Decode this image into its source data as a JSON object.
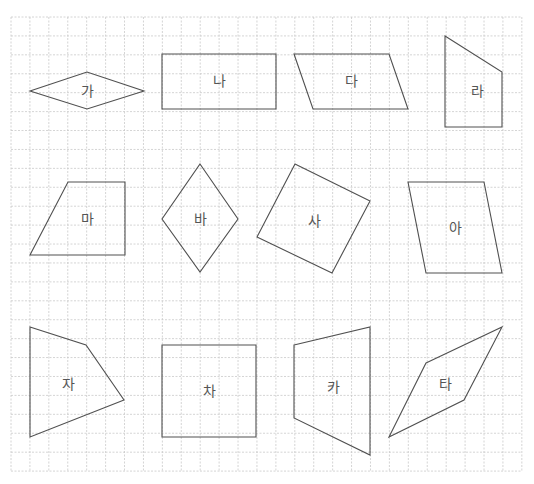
{
  "grid": {
    "origin_x": 11,
    "origin_y": 17,
    "spacing": 18.92,
    "cols": 27,
    "rows": 24,
    "color": "#c9c9c9"
  },
  "colors": {
    "stroke": "#505050",
    "label": "#555555",
    "background": "#ffffff"
  },
  "shapes": [
    {
      "label": "가",
      "points": [
        [
          30,
          91
        ],
        [
          87,
          72
        ],
        [
          144,
          91
        ],
        [
          87,
          109
        ]
      ],
      "label_pos": [
        87,
        91
      ]
    },
    {
      "label": "나",
      "points": [
        [
          162,
          54
        ],
        [
          276,
          54
        ],
        [
          276,
          109
        ],
        [
          162,
          109
        ]
      ],
      "label_pos": [
        219,
        81
      ]
    },
    {
      "label": "다",
      "points": [
        [
          294,
          54
        ],
        [
          389,
          54
        ],
        [
          408,
          109
        ],
        [
          313,
          109
        ]
      ],
      "label_pos": [
        351,
        81
      ]
    },
    {
      "label": "라",
      "points": [
        [
          445,
          36
        ],
        [
          502,
          72
        ],
        [
          502,
          127
        ],
        [
          445,
          127
        ]
      ],
      "label_pos": [
        477,
        91
      ]
    },
    {
      "label": "마",
      "points": [
        [
          68,
          182
        ],
        [
          125,
          182
        ],
        [
          125,
          255
        ],
        [
          30,
          255
        ]
      ],
      "label_pos": [
        87,
        219
      ]
    },
    {
      "label": "바",
      "points": [
        [
          200,
          164
        ],
        [
          238,
          219
        ],
        [
          200,
          272
        ],
        [
          162,
          219
        ]
      ],
      "label_pos": [
        200,
        219
      ]
    },
    {
      "label": "사",
      "points": [
        [
          295,
          164
        ],
        [
          370,
          201
        ],
        [
          332,
          273
        ],
        [
          257,
          237
        ]
      ],
      "label_pos": [
        314,
        221
      ]
    },
    {
      "label": "아",
      "points": [
        [
          408,
          182
        ],
        [
          484,
          182
        ],
        [
          502,
          273
        ],
        [
          426,
          273
        ]
      ],
      "label_pos": [
        455,
        228
      ]
    },
    {
      "label": "자",
      "points": [
        [
          30,
          327
        ],
        [
          86,
          345
        ],
        [
          124,
          400
        ],
        [
          30,
          437
        ]
      ],
      "label_pos": [
        68,
        384
      ]
    },
    {
      "label": "차",
      "points": [
        [
          162,
          345
        ],
        [
          256,
          345
        ],
        [
          256,
          437
        ],
        [
          162,
          437
        ]
      ],
      "label_pos": [
        209,
        391
      ]
    },
    {
      "label": "카",
      "points": [
        [
          294,
          345
        ],
        [
          370,
          327
        ],
        [
          370,
          455
        ],
        [
          294,
          418
        ]
      ],
      "label_pos": [
        333,
        387
      ]
    },
    {
      "label": "타",
      "points": [
        [
          426,
          363
        ],
        [
          502,
          327
        ],
        [
          464,
          400
        ],
        [
          389,
          437
        ]
      ],
      "label_pos": [
        445,
        384
      ]
    }
  ]
}
